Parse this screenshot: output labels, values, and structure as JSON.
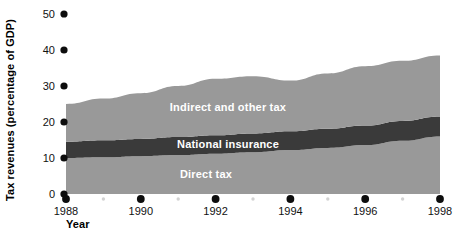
{
  "chart_data": {
    "type": "area",
    "title": "",
    "subtitle": "",
    "xlabel": "Year",
    "ylabel": "Tax revenues (percentage of GDP)",
    "stacked": true,
    "grid": false,
    "legend_position": "inline-band-labels",
    "xlim": [
      1988,
      1998
    ],
    "ylim": [
      0,
      50
    ],
    "ytick_labels": [
      "0",
      "10",
      "20",
      "30",
      "40",
      "50"
    ],
    "ytick_values": [
      0,
      10,
      20,
      30,
      40,
      50
    ],
    "xtick_labels": [
      "1988",
      "1990",
      "1992",
      "1994",
      "1996",
      "1998"
    ],
    "xtick_values": [
      1988,
      1990,
      1992,
      1994,
      1996,
      1998
    ],
    "xtick_minor_values": [
      1989,
      1991,
      1993,
      1995,
      1997
    ],
    "x": [
      1988,
      1989,
      1990,
      1991,
      1992,
      1993,
      1994,
      1995,
      1996,
      1997,
      1998
    ],
    "series": [
      {
        "name": "Direct tax",
        "color": "#999999",
        "values": [
          10.0,
          10.2,
          10.5,
          10.8,
          11.2,
          11.6,
          12.2,
          12.8,
          13.6,
          14.8,
          16.0
        ]
      },
      {
        "name": "National insurance",
        "color": "#3a3a3a",
        "values": [
          4.5,
          4.7,
          4.8,
          5.0,
          5.1,
          5.2,
          5.2,
          5.3,
          5.4,
          5.5,
          5.5
        ]
      },
      {
        "name": "Indirect and other tax",
        "color": "#999999",
        "values": [
          10.5,
          11.6,
          12.7,
          14.2,
          15.7,
          15.9,
          14.1,
          15.4,
          16.5,
          16.7,
          17.0
        ]
      }
    ],
    "stack_totals": [
      25.0,
      26.5,
      28.0,
      30.0,
      32.0,
      32.7,
      31.5,
      33.5,
      35.5,
      37.0,
      38.5
    ],
    "band_labels": {
      "top": "Indirect and other tax",
      "middle": "National insurance",
      "bottom": "Direct tax"
    },
    "colors": {
      "light_band": "#999999",
      "dark_band": "#3a3a3a",
      "background": "#ffffff",
      "tick_major": "#0d0d0d",
      "tick_minor": "#d2d2d2",
      "text": "#111111",
      "band_label_text": "#ffffff"
    }
  }
}
